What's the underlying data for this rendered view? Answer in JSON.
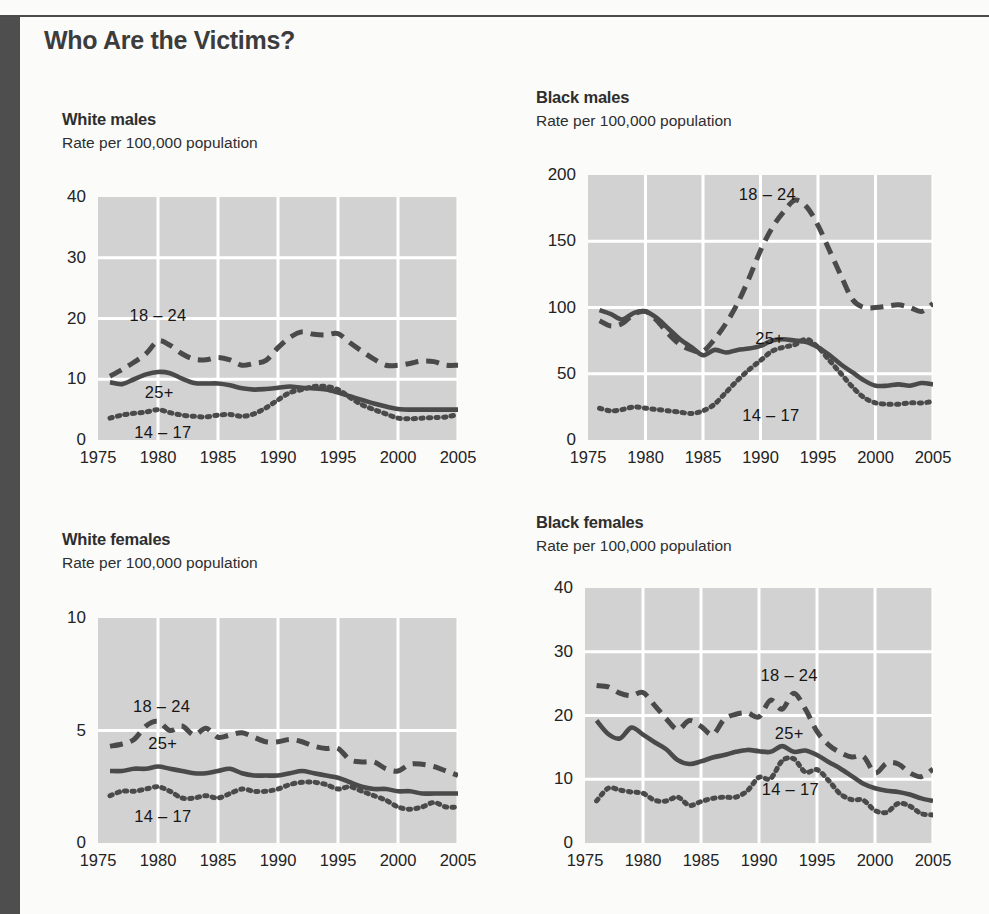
{
  "page": {
    "title": "Who Are the Victims?",
    "accent_dark": "#4e4e4e",
    "plot_bg": "#d2d2d2",
    "gridline_color": "#ffffff",
    "line_color": "#4a4a4a"
  },
  "charts": [
    {
      "id": "white-males",
      "title": "White males",
      "subtitle": "Rate per 100,000 population",
      "series_labels": [
        {
          "text": "18 – 24",
          "x": 1980.0,
          "y": 20.6
        },
        {
          "text": "25+",
          "x": 1980.1,
          "y": 7.9
        },
        {
          "text": "14 – 17",
          "x": 1980.4,
          "y": 1.3
        }
      ]
    },
    {
      "id": "black-males",
      "title": "Black males",
      "subtitle": "Rate per 100,000 population",
      "series_labels": [
        {
          "text": "18 – 24",
          "x": 1990.6,
          "y": 186
        },
        {
          "text": "25+",
          "x": 1990.8,
          "y": 77
        },
        {
          "text": "14 – 17",
          "x": 1990.9,
          "y": 19
        }
      ]
    },
    {
      "id": "white-females",
      "title": "White females",
      "subtitle": "Rate per 100,000 population",
      "series_labels": [
        {
          "text": "18 – 24",
          "x": 1980.3,
          "y": 6.1
        },
        {
          "text": "25+",
          "x": 1980.4,
          "y": 4.45
        },
        {
          "text": "14 – 17",
          "x": 1980.4,
          "y": 1.2
        }
      ]
    },
    {
      "id": "black-females",
      "title": "Black females",
      "subtitle": "Rate per 100,000 population",
      "series_labels": [
        {
          "text": "18 – 24",
          "x": 1992.6,
          "y": 26.4
        },
        {
          "text": "25+",
          "x": 1992.6,
          "y": 17.2
        },
        {
          "text": "14 – 17",
          "x": 1992.7,
          "y": 8.4
        }
      ]
    }
  ],
  "chart_data": [
    {
      "type": "line",
      "id": "white-males",
      "title": "White males",
      "subtitle": "Rate per 100,000 population",
      "xlabel": "",
      "ylabel": "Rate per 100,000 population",
      "xlim": [
        1975,
        2005
      ],
      "ylim": [
        0,
        40
      ],
      "xticks": [
        1975,
        1980,
        1985,
        1990,
        1995,
        2000,
        2005
      ],
      "yticks": [
        0,
        10,
        20,
        30,
        40
      ],
      "grid": true,
      "legend": "inline-annotations",
      "x": [
        1976,
        1977,
        1978,
        1979,
        1980,
        1981,
        1982,
        1983,
        1984,
        1985,
        1986,
        1987,
        1988,
        1989,
        1990,
        1991,
        1992,
        1993,
        1994,
        1995,
        1996,
        1997,
        1998,
        1999,
        2000,
        2001,
        2002,
        2003,
        2004,
        2005
      ],
      "series": [
        {
          "name": "18 – 24",
          "style": "dashed",
          "values": [
            10.5,
            11.6,
            12.8,
            14.2,
            16.3,
            15.6,
            14.2,
            13.3,
            13.2,
            13.6,
            13.2,
            12.3,
            12.6,
            13.1,
            15.2,
            16.9,
            17.8,
            17.4,
            17.3,
            17.5,
            16.0,
            14.6,
            13.3,
            12.3,
            12.3,
            12.6,
            13.0,
            12.9,
            12.3,
            12.3
          ]
        },
        {
          "name": "25+",
          "style": "solid",
          "values": [
            9.5,
            9.2,
            10.0,
            10.8,
            11.2,
            11.0,
            10.1,
            9.4,
            9.3,
            9.3,
            9.0,
            8.5,
            8.3,
            8.4,
            8.6,
            8.8,
            8.6,
            8.5,
            8.3,
            7.8,
            7.2,
            6.6,
            6.0,
            5.5,
            5.1,
            5.0,
            5.0,
            5.0,
            5.0,
            5.0
          ]
        },
        {
          "name": "14 – 17",
          "style": "dotted",
          "values": [
            3.6,
            4.1,
            4.4,
            4.6,
            5.0,
            4.5,
            4.1,
            3.9,
            3.8,
            4.1,
            4.2,
            3.9,
            4.3,
            5.3,
            6.6,
            7.8,
            8.3,
            8.8,
            8.8,
            8.3,
            7.0,
            5.8,
            5.0,
            4.3,
            3.6,
            3.5,
            3.6,
            3.7,
            3.8,
            4.2
          ]
        }
      ]
    },
    {
      "type": "line",
      "id": "black-males",
      "title": "Black males",
      "subtitle": "Rate per 100,000 population",
      "xlabel": "",
      "ylabel": "Rate per 100,000 population",
      "xlim": [
        1975,
        2005
      ],
      "ylim": [
        0,
        200
      ],
      "xticks": [
        1975,
        1980,
        1985,
        1990,
        1995,
        2000,
        2005
      ],
      "yticks": [
        0,
        50,
        100,
        150,
        200
      ],
      "grid": true,
      "legend": "inline-annotations",
      "x": [
        1976,
        1977,
        1978,
        1979,
        1980,
        1981,
        1982,
        1983,
        1984,
        1985,
        1986,
        1987,
        1988,
        1989,
        1990,
        1991,
        1992,
        1993,
        1994,
        1995,
        1996,
        1997,
        1998,
        1999,
        2000,
        2001,
        2002,
        2003,
        2004,
        2005
      ],
      "series": [
        {
          "name": "18 – 24",
          "style": "dashed",
          "values": [
            90,
            86,
            88,
            95,
            97,
            90,
            80,
            72,
            68,
            67,
            76,
            88,
            103,
            122,
            143,
            160,
            172,
            181,
            176,
            162,
            143,
            124,
            106,
            100,
            100,
            101,
            102,
            100,
            97,
            103
          ]
        },
        {
          "name": "25+",
          "style": "solid",
          "values": [
            98,
            95,
            91,
            96,
            97,
            92,
            84,
            76,
            70,
            64,
            68,
            66,
            68,
            69,
            71,
            75,
            76,
            75,
            74,
            70,
            64,
            57,
            51,
            45,
            41,
            41,
            42,
            41,
            43,
            42
          ]
        },
        {
          "name": "14 – 17",
          "style": "dotted",
          "values": [
            24,
            22,
            23,
            25,
            24,
            23,
            22,
            21,
            20,
            22,
            27,
            36,
            45,
            53,
            60,
            67,
            70,
            72,
            76,
            70,
            60,
            50,
            40,
            32,
            28,
            27,
            27,
            28,
            28,
            29
          ]
        }
      ]
    },
    {
      "type": "line",
      "id": "white-females",
      "title": "White females",
      "subtitle": "Rate per 100,000 population",
      "xlabel": "",
      "ylabel": "Rate per 100,000 population",
      "xlim": [
        1975,
        2005
      ],
      "ylim": [
        0,
        10
      ],
      "xticks": [
        1975,
        1980,
        1985,
        1990,
        1995,
        2000,
        2005
      ],
      "yticks": [
        0,
        5,
        10
      ],
      "grid": true,
      "legend": "inline-annotations",
      "x": [
        1976,
        1977,
        1978,
        1979,
        1980,
        1981,
        1982,
        1983,
        1984,
        1985,
        1986,
        1987,
        1988,
        1989,
        1990,
        1991,
        1992,
        1993,
        1994,
        1995,
        1996,
        1997,
        1998,
        1999,
        2000,
        2001,
        2002,
        2003,
        2004,
        2005
      ],
      "series": [
        {
          "name": "18 – 24",
          "style": "dashed",
          "values": [
            4.3,
            4.4,
            4.6,
            5.2,
            5.4,
            5.0,
            5.2,
            4.8,
            5.1,
            4.7,
            4.8,
            4.9,
            4.7,
            4.5,
            4.5,
            4.6,
            4.5,
            4.3,
            4.2,
            4.2,
            3.7,
            3.6,
            3.6,
            3.3,
            3.2,
            3.5,
            3.5,
            3.4,
            3.2,
            3.0
          ]
        },
        {
          "name": "25+",
          "style": "solid",
          "values": [
            3.2,
            3.2,
            3.3,
            3.3,
            3.4,
            3.3,
            3.2,
            3.1,
            3.1,
            3.2,
            3.3,
            3.1,
            3.0,
            3.0,
            3.0,
            3.1,
            3.2,
            3.1,
            3.0,
            2.9,
            2.7,
            2.5,
            2.4,
            2.4,
            2.3,
            2.3,
            2.2,
            2.2,
            2.2,
            2.2
          ]
        },
        {
          "name": "14 – 17",
          "style": "dotted",
          "values": [
            2.1,
            2.3,
            2.3,
            2.4,
            2.5,
            2.3,
            2.0,
            2.0,
            2.1,
            2.0,
            2.2,
            2.4,
            2.3,
            2.3,
            2.4,
            2.6,
            2.7,
            2.7,
            2.6,
            2.4,
            2.5,
            2.3,
            2.1,
            1.9,
            1.6,
            1.5,
            1.6,
            1.8,
            1.6,
            1.6
          ]
        }
      ]
    },
    {
      "type": "line",
      "id": "black-females",
      "title": "Black females",
      "subtitle": "Rate per 100,000 population",
      "xlabel": "",
      "ylabel": "Rate per 100,000 population",
      "xlim": [
        1975,
        2005
      ],
      "ylim": [
        0,
        40
      ],
      "xticks": [
        1975,
        1980,
        1985,
        1990,
        1995,
        2000,
        2005
      ],
      "yticks": [
        0,
        10,
        20,
        30,
        40
      ],
      "grid": true,
      "legend": "inline-annotations",
      "x": [
        1976,
        1977,
        1978,
        1979,
        1980,
        1981,
        1982,
        1983,
        1984,
        1985,
        1986,
        1987,
        1988,
        1989,
        1990,
        1991,
        1992,
        1993,
        1994,
        1995,
        1996,
        1997,
        1998,
        1999,
        2000,
        2001,
        2002,
        2003,
        2004,
        2005
      ],
      "series": [
        {
          "name": "18 – 24",
          "style": "dashed",
          "values": [
            24.7,
            24.5,
            23.5,
            23.1,
            23.6,
            21.6,
            19.5,
            17.8,
            19.2,
            18.3,
            17.0,
            19.4,
            20.2,
            20.4,
            19.8,
            22.4,
            21.0,
            23.5,
            21.0,
            17.5,
            15.4,
            14.2,
            13.5,
            13.6,
            11.0,
            12.5,
            12.4,
            11.0,
            10.4,
            11.6
          ]
        },
        {
          "name": "25+",
          "style": "solid",
          "values": [
            19.2,
            17.1,
            16.4,
            18.1,
            17.0,
            15.8,
            14.7,
            13.0,
            12.4,
            12.8,
            13.4,
            13.8,
            14.3,
            14.6,
            14.4,
            14.3,
            15.2,
            14.3,
            14.5,
            13.8,
            12.7,
            11.7,
            10.5,
            9.3,
            8.6,
            8.2,
            8.0,
            7.6,
            7.0,
            6.6
          ]
        },
        {
          "name": "14 – 17",
          "style": "dotted",
          "values": [
            6.6,
            8.6,
            8.3,
            8.0,
            7.8,
            6.7,
            6.6,
            7.2,
            5.9,
            6.5,
            7.0,
            7.2,
            7.2,
            8.2,
            10.3,
            10.1,
            12.9,
            13.2,
            11.1,
            11.5,
            9.8,
            7.7,
            6.8,
            6.7,
            5.1,
            4.8,
            6.2,
            5.8,
            4.6,
            4.4
          ]
        }
      ]
    }
  ]
}
